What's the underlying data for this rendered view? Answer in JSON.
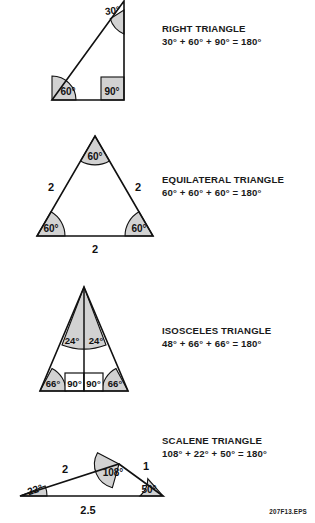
{
  "sheet": {
    "code": "207F13.EPS",
    "background": "#ffffff",
    "ink": "#000000",
    "shade": "#d2d2d2"
  },
  "figures": [
    {
      "id": "right-triangle",
      "title": "RIGHT TRIANGLE",
      "sum": "30° + 60° + 90° = 180°",
      "angles": [
        "30°",
        "60°",
        "90°"
      ],
      "sides": [],
      "angle_values": [
        30,
        60,
        90
      ],
      "total": "180°"
    },
    {
      "id": "equilateral-triangle",
      "title": "EQUILATERAL TRIANGLE",
      "sum": "60° + 60° + 60° = 180°",
      "angles": [
        "60°",
        "60°",
        "60°"
      ],
      "sides": [
        "2",
        "2",
        "2"
      ],
      "angle_values": [
        60,
        60,
        60
      ],
      "total": "180°"
    },
    {
      "id": "isosceles-triangle",
      "title": "ISOSCELES TRIANGLE",
      "sum": "48° + 66° + 66° = 180°",
      "angles": [
        "24°",
        "24°",
        "66°",
        "66°",
        "90°",
        "90°"
      ],
      "sides": [],
      "angle_values": [
        48,
        66,
        66
      ],
      "total": "180°"
    },
    {
      "id": "scalene-triangle",
      "title": "SCALENE TRIANGLE",
      "sum": "108° + 22° + 50° = 180°",
      "angles": [
        "108°",
        "22°",
        "50°"
      ],
      "sides": [
        "2",
        "1",
        "2.5"
      ],
      "angle_values": [
        108,
        22,
        50
      ],
      "total": "180°"
    }
  ],
  "labels": {
    "right": {
      "apex": "30°",
      "left_base": "60°",
      "right_base": "90°"
    },
    "equilateral": {
      "apex": "60°",
      "left_base": "60°",
      "right_base": "60°",
      "left_side": "2",
      "right_side": "2",
      "bottom_side": "2"
    },
    "isosceles": {
      "apex_left": "24°",
      "apex_right": "24°",
      "foot_left": "90°",
      "foot_right": "90°",
      "left_base": "66°",
      "right_base": "66°"
    },
    "scalene": {
      "apex": "108°",
      "left_base": "22°",
      "right_base": "50°",
      "left_side": "2",
      "right_side": "1",
      "bottom_side": "2.5"
    }
  }
}
